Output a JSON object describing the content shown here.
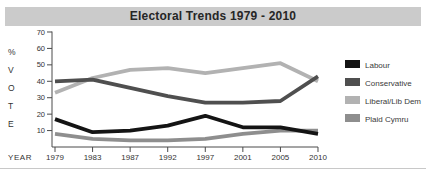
{
  "title": "Electoral Trends 1979 - 2010",
  "chart_data": {
    "type": "line",
    "title": "Electoral Trends 1979 - 2010",
    "x": [
      1979,
      1983,
      1987,
      1992,
      1997,
      2001,
      2005,
      2010
    ],
    "xlabel": "YEAR",
    "ylabel": "% VOTE",
    "ylim": [
      0,
      70
    ],
    "yticks": [
      10,
      20,
      30,
      40,
      50,
      60,
      70
    ],
    "grid": false,
    "legend_position": "right",
    "series": [
      {
        "name": "Labour",
        "color": "#141414",
        "values": [
          17,
          9,
          10,
          13,
          19,
          12,
          12,
          8
        ]
      },
      {
        "name": "Conservative",
        "color": "#4f4f4f",
        "values": [
          40,
          41,
          36,
          31,
          27,
          27,
          28,
          43
        ]
      },
      {
        "name": "Liberal/Lib Dem",
        "color": "#b2b2b2",
        "values": [
          33,
          42,
          47,
          48,
          45,
          48,
          51,
          40
        ]
      },
      {
        "name": "Plaid Cymru",
        "color": "#8e8e8e",
        "values": [
          8,
          5,
          4,
          4,
          5,
          8,
          10,
          10
        ]
      }
    ]
  },
  "colors": {
    "title_bar_bg": "#cbcbcb",
    "axis": "#4a4a4a",
    "tick_text": "#333333",
    "legend_text": "#3a3a3a"
  }
}
